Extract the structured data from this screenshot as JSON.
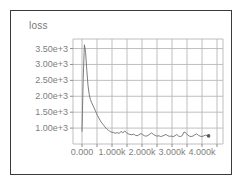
{
  "figure": {
    "title": "loss",
    "frame_color": "#3a3a3a",
    "background_color": "#ffffff",
    "tick_label_color": "#808080",
    "grid_color": "#b8b8b8",
    "line_color": "#6e6e6e"
  },
  "chart_data": {
    "type": "line",
    "title": "loss",
    "xlabel": "",
    "ylabel": "",
    "grid": true,
    "legend": null,
    "xlim": [
      -300,
      4700
    ],
    "ylim": [
      500,
      3800
    ],
    "xticks": [
      0,
      1000,
      2000,
      3000,
      4000
    ],
    "xtick_labels": [
      "0.000",
      "1.000k",
      "2.000k",
      "3.000k",
      "4.000k"
    ],
    "yticks": [
      1000,
      1500,
      2000,
      2500,
      3000,
      3500
    ],
    "ytick_labels": [
      "1.00e+3",
      "1.50e+3",
      "2.00e+3",
      "2.50e+3",
      "3.00e+3",
      "3.50e+3"
    ],
    "end_marker": true,
    "series": [
      {
        "name": "loss",
        "x": [
          0,
          40,
          80,
          120,
          160,
          200,
          240,
          280,
          320,
          360,
          400,
          440,
          480,
          520,
          560,
          600,
          640,
          680,
          720,
          760,
          800,
          840,
          880,
          920,
          960,
          1000,
          1060,
          1120,
          1180,
          1240,
          1300,
          1360,
          1420,
          1480,
          1540,
          1600,
          1660,
          1720,
          1780,
          1840,
          1900,
          1960,
          2020,
          2080,
          2140,
          2200,
          2260,
          2320,
          2380,
          2440,
          2500,
          2560,
          2620,
          2680,
          2740,
          2800,
          2860,
          2920,
          2980,
          3040,
          3100,
          3160,
          3220,
          3280,
          3340,
          3400,
          3460,
          3520,
          3580,
          3640,
          3700,
          3760,
          3820,
          3880,
          3940,
          4000,
          4060,
          4120,
          4180,
          4220
        ],
        "y": [
          900,
          2550,
          3620,
          3380,
          2820,
          2340,
          2060,
          1900,
          1800,
          1720,
          1640,
          1560,
          1470,
          1390,
          1320,
          1250,
          1190,
          1140,
          1090,
          1040,
          1000,
          960,
          930,
          905,
          880,
          870,
          855,
          840,
          860,
          830,
          900,
          845,
          910,
          860,
          820,
          800,
          790,
          810,
          775,
          760,
          790,
          830,
          795,
          760,
          745,
          770,
          810,
          850,
          800,
          770,
          745,
          760,
          735,
          750,
          775,
          800,
          760,
          740,
          750,
          730,
          760,
          800,
          745,
          735,
          760,
          880,
          845,
          790,
          745,
          735,
          750,
          790,
          820,
          775,
          745,
          735,
          755,
          780,
          760,
          755
        ]
      }
    ]
  }
}
